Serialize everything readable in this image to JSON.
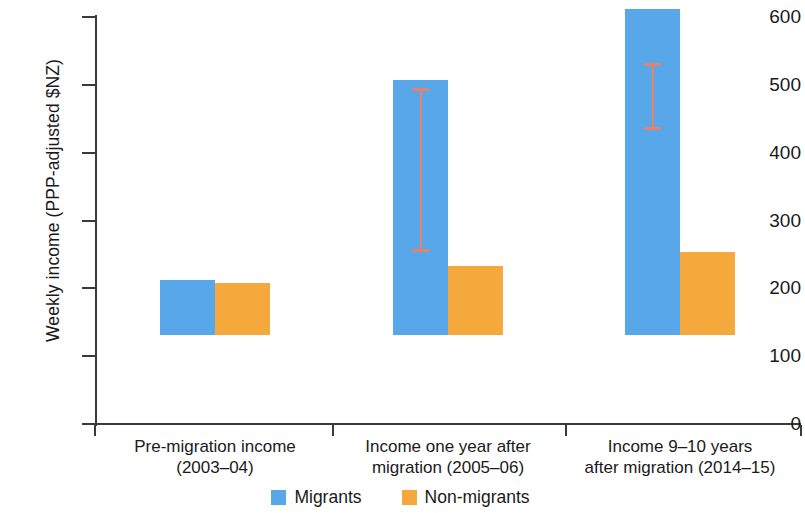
{
  "chart_data": {
    "type": "bar",
    "title": "",
    "xlabel": "",
    "ylabel": "Weekly income (PPP-adjusted $NZ)",
    "ylim": [
      0,
      600
    ],
    "yticks": [
      0,
      100,
      200,
      300,
      400,
      500,
      600
    ],
    "ytick_labels": [
      "0",
      "100",
      "200",
      "300",
      "400",
      "500",
      "600"
    ],
    "grid": false,
    "legend_position": "bottom-center",
    "categories": [
      "Pre-migration income (2003–04)",
      "Income one year after migration (2005–06)",
      "Income 9–10 years after migration (2014–15)"
    ],
    "category_lines": [
      [
        "Pre-migration income",
        "(2003–04)"
      ],
      [
        "Income one year after",
        "migration (2005–06)"
      ],
      [
        "Income 9–10 years",
        "after migration (2014–15)"
      ]
    ],
    "series": [
      {
        "name": "Migrants",
        "color": "#58a7e8",
        "values": [
          81,
          376,
          481
        ],
        "error_low": [
          null,
          253,
          434
        ],
        "error_high": [
          null,
          496,
          532
        ]
      },
      {
        "name": "Non-migrants",
        "color": "#f5a83c",
        "values": [
          76,
          102,
          122
        ],
        "error_low": [
          null,
          null,
          null
        ],
        "error_high": [
          null,
          null,
          null
        ]
      }
    ],
    "errorbar_color": "#e8806b",
    "axis_color": "#3a3a3a"
  },
  "legend": {
    "items": [
      {
        "label": "Migrants",
        "color": "#58a7e8"
      },
      {
        "label": "Non-migrants",
        "color": "#f5a83c"
      }
    ]
  }
}
